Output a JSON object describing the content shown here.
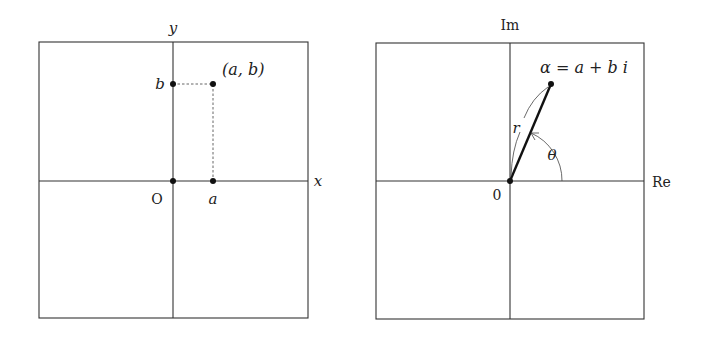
{
  "panels": [
    {
      "name": "cartesian-plane",
      "axes": {
        "x_label": "x",
        "y_label": "y",
        "origin_label": "O"
      },
      "point": {
        "label": "(a, b)",
        "x_label": "a",
        "y_label": "b"
      }
    },
    {
      "name": "complex-plane",
      "axes": {
        "x_label": "Re",
        "y_label": "Im",
        "origin_label": "0"
      },
      "point": {
        "label": "α = a + b i"
      },
      "modulus_label": "r",
      "argument_label": "θ"
    }
  ],
  "colors": {
    "line": "#333333",
    "point": "#111111",
    "background": "#ffffff"
  }
}
